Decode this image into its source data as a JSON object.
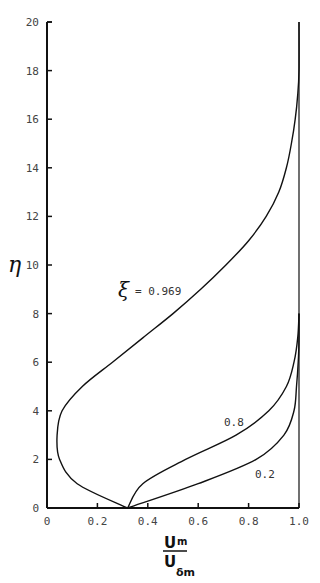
{
  "chart_data": {
    "type": "line",
    "title": "",
    "xlabel": "U_m / U_δm",
    "xlabel_numerator": "U",
    "xlabel_numerator_sub": "m",
    "xlabel_denominator": "U",
    "xlabel_denominator_sub": "δm",
    "ylabel": "η",
    "xlim": [
      0,
      1.0
    ],
    "ylim": [
      0,
      20
    ],
    "grid": false,
    "x_ticks": [
      "0",
      "0.2",
      "0.4",
      "0.6",
      "0.8",
      "1.0"
    ],
    "y_ticks": [
      "0",
      "2",
      "4",
      "6",
      "8",
      "10",
      "12",
      "14",
      "16",
      "18",
      "20"
    ],
    "legend": null,
    "annotations": [
      {
        "text": "ξ",
        "value": "= 0.969",
        "x": 0.27,
        "y": 9.2
      },
      {
        "text": "0.8",
        "x": 0.67,
        "y": 3.2
      },
      {
        "text": "0.2",
        "x": 0.81,
        "y": 1.2
      }
    ],
    "series": [
      {
        "name": "ξ = 0.969",
        "x": [
          0.32,
          0.12,
          0.05,
          0.04,
          0.06,
          0.14,
          0.26,
          0.38,
          0.5,
          0.61,
          0.71,
          0.8,
          0.87,
          0.92,
          0.95,
          0.97,
          0.985,
          0.995,
          1.0,
          1.0
        ],
        "y": [
          0,
          1,
          2,
          3,
          4,
          5,
          6,
          7,
          8,
          9,
          10,
          11,
          12,
          13,
          14,
          15,
          16,
          17,
          18,
          20
        ]
      },
      {
        "name": "ξ = 0.8",
        "x": [
          0.32,
          0.38,
          0.55,
          0.75,
          0.88,
          0.95,
          0.98,
          0.995,
          1.0
        ],
        "y": [
          0,
          1,
          2,
          3,
          4,
          5,
          6,
          7,
          8
        ]
      },
      {
        "name": "ξ = 0.2",
        "x": [
          0.32,
          0.6,
          0.83,
          0.94,
          0.98,
          0.99,
          0.997,
          1.0,
          1.0
        ],
        "y": [
          0,
          1,
          2,
          3,
          4,
          5,
          6,
          7,
          8
        ]
      }
    ],
    "boundary_line": {
      "x": 1.0,
      "y_range": [
        0,
        20
      ]
    }
  },
  "labels": {
    "ylabel": "η",
    "xi_symbol": "ξ",
    "xi_value": "= 0.969",
    "curve_08": "0.8",
    "curve_02": "0.2",
    "x_num": "U",
    "x_num_sub": "m",
    "x_den": "U",
    "x_den_sub": "δm"
  },
  "colors": {
    "line": "#111111",
    "axis": "#111111",
    "text": "#444444"
  }
}
